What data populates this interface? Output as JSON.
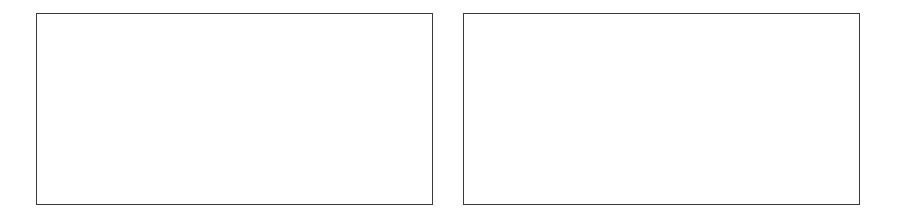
{
  "panels": [
    {
      "id": "left",
      "content": ""
    },
    {
      "id": "right",
      "content": ""
    }
  ],
  "colors": {
    "border": "#3a3a3a",
    "background": "#ffffff"
  }
}
